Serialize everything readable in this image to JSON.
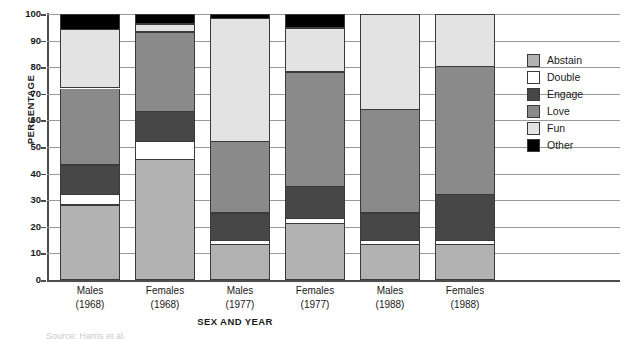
{
  "chart_data": {
    "type": "bar",
    "subtype": "stacked-bar-100pct",
    "title": "",
    "xlabel": "SEX AND YEAR",
    "ylabel": "PERCENTAGE",
    "ylim": [
      0,
      100
    ],
    "ytick_step": 10,
    "yticks": [
      0,
      10,
      20,
      30,
      40,
      50,
      60,
      70,
      80,
      90,
      100
    ],
    "ytick_labels": [
      "0",
      "10",
      "20",
      "30",
      "40",
      "50",
      "60",
      "70",
      "80",
      "90",
      "100"
    ],
    "grid": true,
    "grid_axis": "y",
    "legend_position": "right",
    "categories": [
      {
        "line1": "Males",
        "line2": "(1968)"
      },
      {
        "line1": "Females",
        "line2": "(1968)"
      },
      {
        "line1": "Males",
        "line2": "(1977)"
      },
      {
        "line1": "Females",
        "line2": "(1977)"
      },
      {
        "line1": "Males",
        "line2": "(1988)"
      },
      {
        "line1": "Females",
        "line2": "(1988)"
      }
    ],
    "category_labels": [
      "Males (1968)",
      "Females (1968)",
      "Males (1977)",
      "Females (1977)",
      "Males (1988)",
      "Females (1988)"
    ],
    "series": [
      {
        "name": "Abstain",
        "color": "#b2b2b2",
        "values": [
          28,
          45,
          13,
          21,
          13,
          13
        ]
      },
      {
        "name": "Double",
        "color": "#ffffff",
        "values": [
          4,
          7,
          1.5,
          2,
          1.5,
          1.5
        ]
      },
      {
        "name": "Engage",
        "color": "#474747",
        "values": [
          11,
          11,
          10.5,
          12,
          10.5,
          17.5
        ]
      },
      {
        "name": "Love",
        "color": "#8a8a8a",
        "values": [
          29,
          30,
          27,
          43,
          39,
          48
        ]
      },
      {
        "name": "Fun",
        "color": "#e3e3e3",
        "values": [
          22,
          3,
          46,
          16.5,
          36,
          20
        ]
      },
      {
        "name": "Other",
        "color": "#000000",
        "values": [
          6,
          4,
          2,
          5.5,
          0,
          0
        ]
      }
    ],
    "legend_entries": [
      "Abstain",
      "Double",
      "Engage",
      "Love",
      "Fun",
      "Other"
    ]
  },
  "caption_clipped": "Source: Harris et al."
}
